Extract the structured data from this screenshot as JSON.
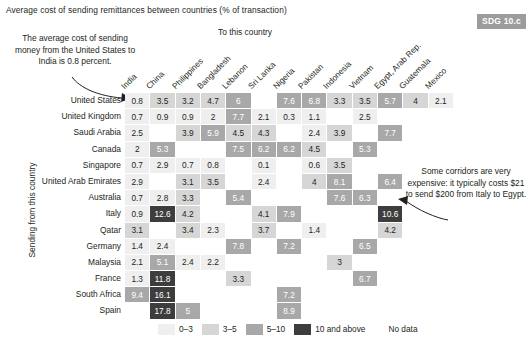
{
  "title": "Average cost of sending remittances between countries (% of transaction)",
  "badge": "SDG 10.c",
  "axis_top_label": "To this country",
  "axis_left_label": "Sending from this country",
  "annotations": {
    "left": "The average cost of sending money from the United States to India is 0.8 percent.",
    "right": "Some corridors are very expensive: it typically costs $21 to send $200 from Italy to Egypt."
  },
  "legend": {
    "items": [
      {
        "label": "0–3",
        "color": "#efefef"
      },
      {
        "label": "3–5",
        "color": "#d6d6d6"
      },
      {
        "label": "5–10",
        "color": "#a8a8a8"
      },
      {
        "label": "10 and above",
        "color": "#3d3d3d"
      }
    ],
    "no_data_label": "No data"
  },
  "chart_data": {
    "type": "heatmap",
    "title": "Average cost of sending remittances between countries (% of transaction)",
    "xlabel": "To this country",
    "ylabel": "Sending from this country",
    "columns": [
      "India",
      "China",
      "Philippines",
      "Bangladesh",
      "Lebanon",
      "Sri Lanka",
      "Nigeria",
      "Pakistan",
      "Indonesia",
      "Vietnam",
      "Egypt, Arab Rep.",
      "Guatemala",
      "Mexico"
    ],
    "rows": [
      "United States",
      "United Kingdom",
      "Saudi Arabia",
      "Canada",
      "Singapore",
      "United Arab Emirates",
      "Australia",
      "Italy",
      "Qatar",
      "Germany",
      "Malaysia",
      "France",
      "South Africa",
      "Spain"
    ],
    "bins": [
      {
        "label": "0–3",
        "min": 0,
        "max": 3,
        "color": "#efefef"
      },
      {
        "label": "3–5",
        "min": 3,
        "max": 5,
        "color": "#d6d6d6"
      },
      {
        "label": "5–10",
        "min": 5,
        "max": 10,
        "color": "#a8a8a8"
      },
      {
        "label": "10 and above",
        "min": 10,
        "max": null,
        "color": "#3d3d3d"
      }
    ],
    "no_data": null,
    "values": [
      [
        0.8,
        3.5,
        3.2,
        4.7,
        6,
        null,
        7.6,
        6.8,
        3.3,
        3.5,
        5.7,
        4,
        2.1
      ],
      [
        0.7,
        0.9,
        0.9,
        2,
        7.7,
        2.1,
        0.3,
        1.1,
        null,
        2.5,
        null,
        null,
        null
      ],
      [
        2.5,
        null,
        3.9,
        5.9,
        4.5,
        4.3,
        null,
        2.4,
        3.9,
        null,
        7.7,
        null,
        null
      ],
      [
        2,
        5.3,
        null,
        null,
        7.5,
        6.2,
        6.2,
        4.5,
        null,
        5.3,
        null,
        null,
        null
      ],
      [
        0.7,
        2.9,
        0.7,
        0.8,
        null,
        0.1,
        null,
        0.6,
        3.5,
        null,
        null,
        null,
        null
      ],
      [
        2.9,
        null,
        3.1,
        3.5,
        null,
        2.4,
        null,
        4,
        8.1,
        null,
        6.4,
        null,
        null
      ],
      [
        0.7,
        2.8,
        3.3,
        null,
        5.4,
        null,
        null,
        null,
        7.6,
        6.3,
        null,
        null,
        null
      ],
      [
        0.9,
        12.6,
        4.2,
        null,
        null,
        4.1,
        7.9,
        null,
        null,
        null,
        10.6,
        null,
        null
      ],
      [
        3.1,
        null,
        3.4,
        2.3,
        null,
        3.7,
        null,
        1.4,
        null,
        null,
        4.2,
        null,
        null
      ],
      [
        1.4,
        2.4,
        null,
        null,
        7.8,
        null,
        7.2,
        null,
        null,
        6.5,
        null,
        null,
        null
      ],
      [
        2.1,
        5.1,
        2.4,
        2.2,
        null,
        null,
        null,
        null,
        3,
        null,
        null,
        null,
        null
      ],
      [
        1.3,
        11.8,
        null,
        null,
        3.3,
        null,
        null,
        null,
        null,
        6.7,
        null,
        null,
        null
      ],
      [
        9.4,
        16.1,
        null,
        null,
        null,
        null,
        7.2,
        null,
        null,
        null,
        null,
        null,
        null
      ],
      [
        null,
        17.8,
        5,
        null,
        null,
        null,
        8.9,
        null,
        null,
        null,
        null,
        null,
        null
      ]
    ]
  }
}
